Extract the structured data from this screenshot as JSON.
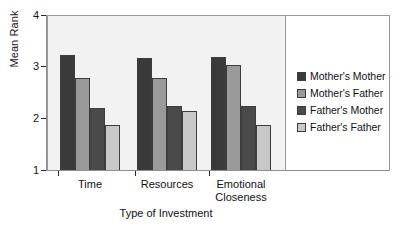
{
  "chart_data": {
    "type": "bar",
    "title": "",
    "xlabel": "Type of Investment",
    "ylabel": "Mean Rank",
    "categories": [
      "Time",
      "Resources",
      "Emotional\nCloseness"
    ],
    "series": [
      {
        "name": "Mother's Mother",
        "color": "#3a3a3a",
        "values": [
          3.25,
          3.18,
          3.2
        ]
      },
      {
        "name": "Mother's Father",
        "color": "#9a9a9a",
        "values": [
          2.8,
          2.8,
          3.05
        ]
      },
      {
        "name": "Father's Mother",
        "color": "#4a4a4a",
        "values": [
          2.22,
          2.25,
          2.25
        ]
      },
      {
        "name": "Father's Father",
        "color": "#c8c8c8",
        "values": [
          1.9,
          2.17,
          1.9
        ]
      }
    ],
    "ylim": [
      1,
      4
    ],
    "yticks": [
      1,
      2,
      3,
      4
    ],
    "ytick_labels": [
      "1",
      "2",
      "3",
      "4"
    ],
    "grid": false,
    "legend_position": "right",
    "plot_background": "#f2f2f2",
    "legend_background": "#ffffff",
    "bar_edge_color": "#3d3d3d",
    "axis_color": "#8e8e8e"
  }
}
